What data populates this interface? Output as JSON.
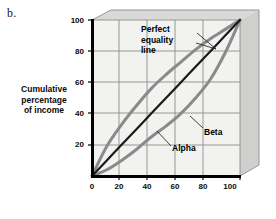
{
  "figure": {
    "panel_label": "b.",
    "background_color": "#ffffff"
  },
  "axes": {
    "ylabel": "Cumulative percentage of income",
    "ylabel_line1": "Cumulative",
    "ylabel_line2": "percentage",
    "ylabel_line3": "of income",
    "xlabel": "Cumulative percentage of families",
    "yticks": [
      "100",
      "80",
      "60",
      "40",
      "20"
    ],
    "xticks": [
      "0",
      "20",
      "40",
      "60",
      "80",
      "100"
    ],
    "plot_fill": "#f2f2f0",
    "grid_color": "#8c8c8c",
    "axis_color": "#000000",
    "bevel_top": "#d9d9d7",
    "bevel_side": "#cfcfcd"
  },
  "annotations": {
    "equality_line1": "Perfect",
    "equality_line2": "equality",
    "equality_line3": "line",
    "beta": "Beta",
    "alpha": "Alpha"
  },
  "chart_data": {
    "type": "line",
    "title": "",
    "subtitle": "",
    "xlabel": "Cumulative percentage of families",
    "ylabel": "Cumulative percentage of income",
    "xlim": [
      0,
      100
    ],
    "ylim": [
      0,
      100
    ],
    "xticks": [
      0,
      20,
      40,
      60,
      80,
      100
    ],
    "yticks": [
      0,
      20,
      40,
      60,
      80,
      100
    ],
    "grid": true,
    "legend": "annotations-inline",
    "x": [
      0,
      10,
      20,
      30,
      40,
      50,
      60,
      70,
      80,
      90,
      100
    ],
    "series": [
      {
        "name": "Perfect equality line",
        "color": "#1a1a1a",
        "width": 2.2,
        "values": [
          0,
          10,
          20,
          30,
          40,
          50,
          60,
          70,
          80,
          90,
          100
        ]
      },
      {
        "name": "Alpha",
        "color": "#8a8a8a",
        "width": 3.0,
        "values": [
          0,
          19,
          33,
          45,
          56,
          65,
          73,
          81,
          88,
          94,
          100
        ]
      },
      {
        "name": "Beta",
        "color": "#8a8a8a",
        "width": 3.0,
        "values": [
          0,
          4,
          10,
          17,
          25,
          32,
          40,
          50,
          62,
          79,
          100
        ]
      }
    ]
  }
}
